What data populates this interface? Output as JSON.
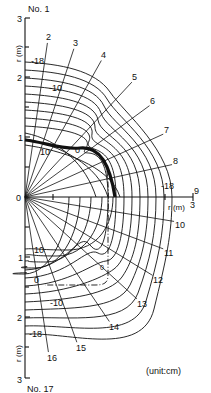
{
  "figure": {
    "unit_label": "(unit:cm)",
    "axis_label": "r (m)",
    "top_line_label": "No. 1",
    "bottom_line_label": "No. 17",
    "origin_label": "0",
    "vertical_ticks_upper": [
      "1",
      "2",
      "3"
    ],
    "vertical_ticks_lower": [
      "1",
      "2",
      "3"
    ],
    "horizontal_end_tick": "3",
    "radial_line_labels": [
      "2",
      "3",
      "4",
      "5",
      "6",
      "7",
      "8",
      "9",
      "10",
      "11",
      "12",
      "13",
      "14",
      "15",
      "16"
    ],
    "contour_labels_upper": [
      "-18",
      "-10",
      "10",
      "0"
    ],
    "contour_labels_right": [
      "-18"
    ],
    "contour_labels_lower": [
      "10",
      "0",
      "-10",
      "-18"
    ],
    "contour_midlabel_dashed": "0",
    "colors": {
      "line": "#111111",
      "background": "#ffffff"
    }
  }
}
